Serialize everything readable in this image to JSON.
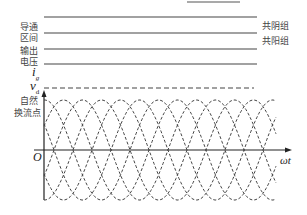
{
  "labels": {
    "conduction_interval_1": "导通",
    "conduction_interval_2": "区间",
    "output_voltage_1": "输出",
    "output_voltage_2": "电压",
    "ig": "i",
    "ig_sub": "g",
    "vd": "v",
    "vd_sub": "d",
    "natural_commutation_1": "自然",
    "natural_commutation_2": "换流点",
    "origin": "O",
    "x_axis": "ωt",
    "common_cathode": "共阴组",
    "common_anode": "共阳组"
  },
  "waveform": {
    "phases": 6,
    "phase_spacing_deg": 60,
    "zero_crossing_spacing_px": 19,
    "amplitude_px": 50,
    "color": "#444444"
  }
}
